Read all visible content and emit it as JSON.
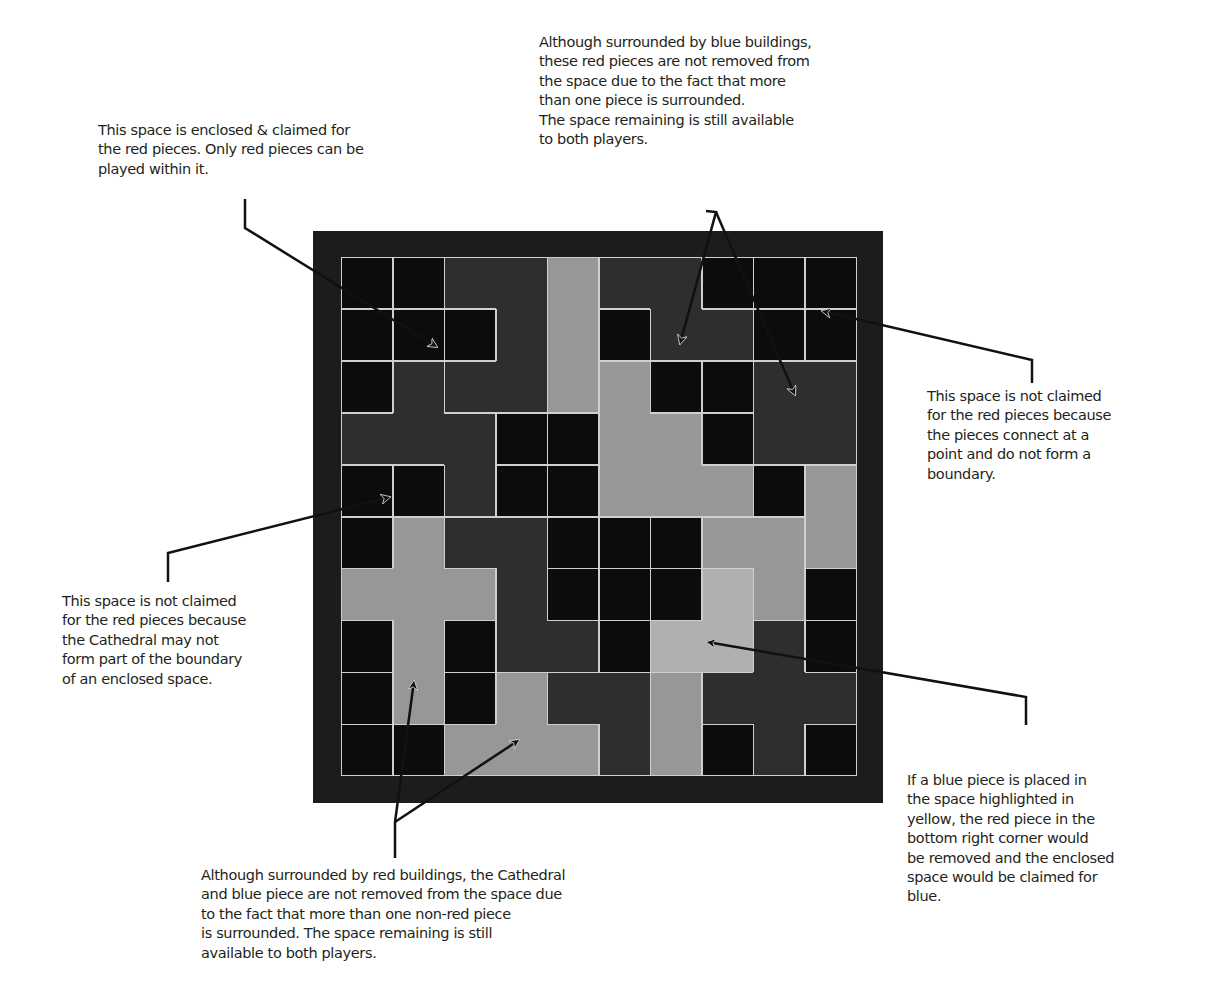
{
  "annotations": {
    "top_left": "This space is enclosed & claimed for\nthe red pieces. Only red pieces can be\nplayed within it.",
    "top_center": "Although surrounded by blue buildings,\nthese red pieces are not removed from\nthe space due to the fact that more\nthan one piece is surrounded.\nThe space remaining is still available\nto both players.",
    "right_upper": "This space is not claimed\nfor the red pieces because\nthe pieces connect at a\npoint and do not form a\nboundary.",
    "left_lower": "This space is not claimed\nfor the red pieces because\nthe Cathedral may not\nform part of the boundary\nof an enclosed space.",
    "right_lower": "If a blue piece is placed in\nthe space highlighted in\nyellow, the red piece in the\nbottom right corner would\nbe removed and the enclosed\nspace would be claimed for\nblue.",
    "bottom": "Although surrounded by red buildings, the Cathedral\nand blue piece are not removed from the space due\nto the fact that more than one non-red piece\nis surrounded. The space remaining is still\navailable to both players."
  },
  "board": {
    "rows": 10,
    "cols": 10,
    "colors": {
      "B": "#0c0c0c",
      "D": "#2e2e2e",
      "L": "#979797",
      "Y": "#b0b0b0",
      "frame": "#1c1c1c",
      "line": "#cfcfcf"
    },
    "cells": [
      [
        "B",
        "B",
        "D",
        "D",
        "L",
        "D",
        "D",
        "B",
        "B",
        "B"
      ],
      [
        "B",
        "B",
        "B",
        "D",
        "L",
        "B",
        "D",
        "D",
        "B",
        "B"
      ],
      [
        "B",
        "D",
        "D",
        "D",
        "L",
        "L",
        "B",
        "B",
        "D",
        "D"
      ],
      [
        "D",
        "D",
        "D",
        "B",
        "B",
        "L",
        "L",
        "B",
        "D",
        "D"
      ],
      [
        "B",
        "B",
        "D",
        "B",
        "B",
        "L",
        "L",
        "L",
        "B",
        "L"
      ],
      [
        "B",
        "L",
        "D",
        "D",
        "B",
        "B",
        "B",
        "L",
        "L",
        "L"
      ],
      [
        "L",
        "L",
        "L",
        "D",
        "B",
        "B",
        "B",
        "Y",
        "L",
        "B"
      ],
      [
        "B",
        "L",
        "B",
        "D",
        "D",
        "B",
        "Y",
        "Y",
        "D",
        "B"
      ],
      [
        "B",
        "L",
        "B",
        "L",
        "D",
        "D",
        "L",
        "D",
        "D",
        "D"
      ],
      [
        "B",
        "B",
        "L",
        "L",
        "L",
        "D",
        "L",
        "B",
        "D",
        "B"
      ]
    ],
    "pieces": [
      [
        1,
        2,
        3,
        3,
        4,
        5,
        5,
        6,
        7,
        8
      ],
      [
        9,
        10,
        11,
        3,
        4,
        12,
        5,
        5,
        13,
        14
      ],
      [
        15,
        16,
        3,
        3,
        4,
        17,
        18,
        19,
        20,
        20
      ],
      [
        16,
        16,
        16,
        21,
        22,
        17,
        17,
        23,
        20,
        20
      ],
      [
        24,
        25,
        16,
        26,
        27,
        17,
        17,
        17,
        28,
        29
      ],
      [
        30,
        31,
        32,
        32,
        33,
        34,
        35,
        36,
        36,
        29
      ],
      [
        31,
        31,
        31,
        32,
        37,
        38,
        39,
        40,
        36,
        41
      ],
      [
        42,
        31,
        43,
        32,
        32,
        44,
        40,
        40,
        45,
        46
      ],
      [
        47,
        31,
        48,
        49,
        50,
        50,
        51,
        45,
        45,
        45
      ],
      [
        52,
        53,
        49,
        49,
        49,
        50,
        51,
        54,
        45,
        55
      ]
    ]
  }
}
